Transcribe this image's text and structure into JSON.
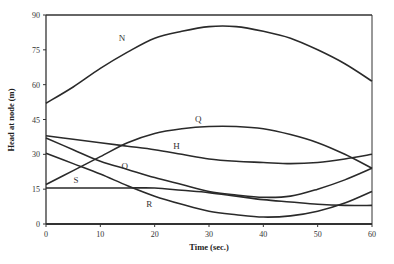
{
  "chart_data": {
    "type": "line",
    "title": "",
    "xlabel": "Time (sec.)",
    "ylabel": "Head at node (m)",
    "xlim": [
      0,
      60
    ],
    "ylim": [
      0,
      90
    ],
    "xticks": [
      0,
      10,
      20,
      30,
      40,
      50,
      60
    ],
    "yticks": [
      0,
      15,
      30,
      45,
      60,
      75,
      90
    ],
    "grid": false,
    "legend": "inline labels",
    "x": [
      0,
      5,
      10,
      15,
      20,
      25,
      30,
      35,
      40,
      45,
      50,
      55,
      60
    ],
    "series": [
      {
        "name": "N",
        "label_pos": [
          14,
          79
        ],
        "values": [
          52,
          59,
          67,
          74,
          80,
          83,
          85,
          85,
          83,
          80,
          75,
          69,
          61.5
        ]
      },
      {
        "name": "Q",
        "label_pos": [
          28,
          44
        ],
        "values": [
          17,
          23,
          29,
          35,
          39,
          41,
          42,
          42,
          41,
          38.5,
          35,
          30,
          24
        ]
      },
      {
        "name": "H",
        "label_pos": [
          24,
          32.5
        ],
        "values": [
          38,
          36.5,
          35,
          33.5,
          32,
          30,
          28,
          27,
          26.5,
          26,
          26.5,
          28,
          30
        ]
      },
      {
        "name": "O",
        "label_pos": [
          14.5,
          23.5
        ],
        "values": [
          37,
          32,
          27,
          23.5,
          20,
          17,
          14,
          12.5,
          11.5,
          12,
          15,
          19,
          24
        ]
      },
      {
        "name": "S",
        "label_pos": [
          5.5,
          17.5
        ],
        "values": [
          15.5,
          15.5,
          15.5,
          15.5,
          15.5,
          14.5,
          13.5,
          12,
          10.5,
          9.5,
          8.5,
          8,
          8
        ]
      },
      {
        "name": "R",
        "label_pos": [
          19,
          7.5
        ],
        "values": [
          30.5,
          26,
          21.5,
          16.5,
          12,
          8.5,
          5.5,
          4,
          3,
          3.5,
          5.5,
          9,
          14
        ]
      }
    ]
  },
  "plot": {
    "left": 46,
    "right": 372,
    "top": 15,
    "bottom": 224,
    "line_color": "#2a2a2a",
    "axis_color": "#333333"
  }
}
